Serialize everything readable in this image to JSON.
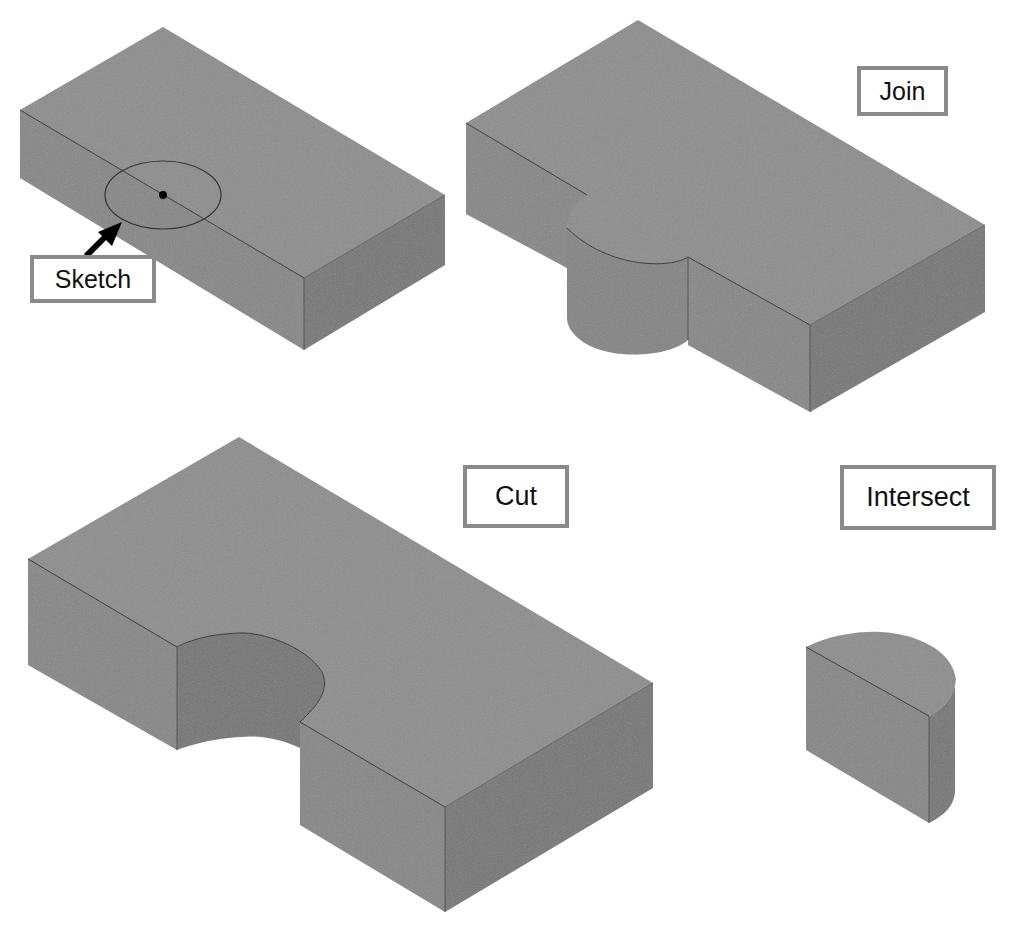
{
  "figure": {
    "labels": {
      "sketch": "Sketch",
      "join": "Join",
      "cut": "Cut",
      "intersect": "Intersect"
    },
    "colors": {
      "top_face": "#8c8c8c",
      "front_face": "#868686",
      "right_face": "#767676",
      "label_border": "#8a8a8a",
      "label_text": "#111111",
      "background": "#ffffff"
    },
    "panels": [
      {
        "name": "base-block-with-sketch",
        "label": "Sketch"
      },
      {
        "name": "join-result",
        "label": "Join"
      },
      {
        "name": "cut-result",
        "label": "Cut"
      },
      {
        "name": "intersect-result",
        "label": "Intersect"
      }
    ]
  }
}
